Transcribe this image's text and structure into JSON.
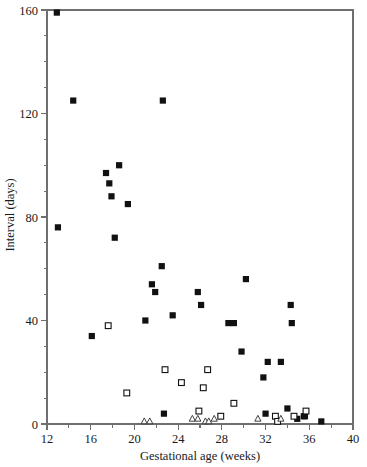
{
  "chart_data": {
    "type": "scatter",
    "title": "",
    "xlabel": "Gestational age (weeks)",
    "ylabel": "Interval (days)",
    "xlim": [
      12,
      40
    ],
    "ylim": [
      0,
      160
    ],
    "xticks": [
      12,
      16,
      20,
      24,
      28,
      32,
      36,
      40
    ],
    "xtick_labels": [
      "12",
      "16",
      "20",
      "24",
      "28",
      "32",
      "36",
      "40"
    ],
    "xminor_step": 2,
    "yticks": [
      0,
      40,
      80,
      120,
      160
    ],
    "ytick_labels": [
      "0",
      "40",
      "80",
      "120",
      "160"
    ],
    "yminor_step": 10,
    "grid": false,
    "legend": null,
    "legend_position": "none",
    "series": [
      {
        "name": "filled-square",
        "marker": "filled-square",
        "color": "#111111",
        "points": [
          [
            12.9,
            159
          ],
          [
            13.0,
            76
          ],
          [
            14.4,
            125
          ],
          [
            16.1,
            34
          ],
          [
            17.4,
            97
          ],
          [
            17.7,
            93
          ],
          [
            17.9,
            88
          ],
          [
            18.2,
            72
          ],
          [
            18.6,
            100
          ],
          [
            19.4,
            85
          ],
          [
            21.0,
            40
          ],
          [
            21.6,
            54
          ],
          [
            21.9,
            51
          ],
          [
            22.5,
            61
          ],
          [
            22.6,
            125
          ],
          [
            22.7,
            4
          ],
          [
            23.5,
            42
          ],
          [
            25.8,
            51
          ],
          [
            26.1,
            46
          ],
          [
            28.6,
            39
          ],
          [
            29.1,
            39
          ],
          [
            29.8,
            28
          ],
          [
            30.2,
            56
          ],
          [
            31.8,
            18
          ],
          [
            32.0,
            4
          ],
          [
            32.2,
            24
          ],
          [
            33.4,
            24
          ],
          [
            34.0,
            6
          ],
          [
            34.3,
            46
          ],
          [
            34.4,
            39
          ],
          [
            34.9,
            2
          ],
          [
            35.5,
            3
          ],
          [
            35.6,
            3
          ],
          [
            37.1,
            1
          ]
        ]
      },
      {
        "name": "open-square",
        "marker": "open-square",
        "color": "#111111",
        "points": [
          [
            17.6,
            38
          ],
          [
            19.3,
            12
          ],
          [
            22.8,
            21
          ],
          [
            24.3,
            16
          ],
          [
            25.9,
            5
          ],
          [
            26.3,
            14
          ],
          [
            26.7,
            21
          ],
          [
            27.9,
            3
          ],
          [
            29.1,
            8
          ],
          [
            32.9,
            3
          ],
          [
            33.1,
            1
          ],
          [
            34.6,
            3
          ],
          [
            35.7,
            5
          ]
        ]
      },
      {
        "name": "open-triangle",
        "marker": "open-triangle",
        "color": "#2b2b2b",
        "points": [
          [
            20.9,
            1
          ],
          [
            21.4,
            1
          ],
          [
            25.3,
            2
          ],
          [
            25.8,
            2
          ],
          [
            26.5,
            1
          ],
          [
            26.8,
            1
          ],
          [
            27.3,
            2
          ],
          [
            31.3,
            2
          ],
          [
            33.4,
            2
          ]
        ]
      }
    ]
  },
  "axes": {
    "x_title": "Gestational age (weeks)",
    "y_title": "Interval (days)"
  }
}
